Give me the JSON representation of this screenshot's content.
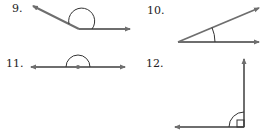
{
  "figures": [
    {
      "number": "9.",
      "angle_type": "obtuse",
      "label_x": 14,
      "label_y": 3
    },
    {
      "number": "10.",
      "angle_type": "acute",
      "label_x": 148,
      "label_y": 5
    },
    {
      "number": "11.",
      "angle_type": "straight",
      "label_x": 6,
      "label_y": 57
    },
    {
      "number": "12.",
      "angle_type": "right",
      "label_x": 146,
      "label_y": 57
    }
  ],
  "colors": {
    "ray": "#6e6e6e",
    "arc": "#333333",
    "label": "#222222"
  }
}
